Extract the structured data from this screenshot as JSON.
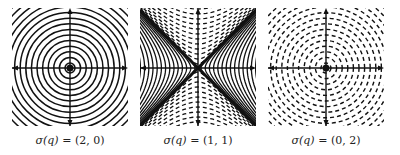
{
  "figure": {
    "panels": [
      {
        "id": "elliptic",
        "signature": "(2,0)",
        "caption_lhs": "σ(q)",
        "caption_eq": " = ",
        "caption_rhs": "(2, 0)",
        "curve_type": "solid concentric circles",
        "center_marker": "dot"
      },
      {
        "id": "hyperbolic",
        "signature": "(1,1)",
        "caption_lhs": "σ(q)",
        "caption_eq": " = ",
        "caption_rhs": "(1, 1)",
        "curve_type": "solid hyperbolas (left/right) and dashed hyperbolas (up/down) with asymptote cross",
        "center_marker": "none"
      },
      {
        "id": "negative-definite",
        "signature": "(0,2)",
        "caption_lhs": "σ(q)",
        "caption_eq": " = ",
        "caption_rhs": "(0, 2)",
        "curve_type": "dashed concentric circles",
        "center_marker": "dot"
      }
    ],
    "colors": {
      "ink": "#111111",
      "background": "#ffffff",
      "caption": "#222222"
    }
  }
}
